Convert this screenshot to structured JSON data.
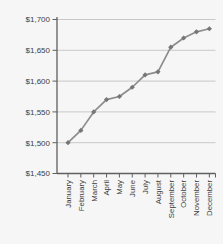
{
  "figure": {
    "name": "monthly-dollar-amount-line-chart",
    "title": "",
    "xlabel": "",
    "ylabel": ""
  },
  "chart_data": {
    "type": "line",
    "categories": [
      "January",
      "February",
      "March",
      "April",
      "May",
      "June",
      "July",
      "August",
      "September",
      "October",
      "November",
      "December"
    ],
    "values": [
      1500,
      1520,
      1550,
      1570,
      1575,
      1590,
      1610,
      1615,
      1655,
      1670,
      1680,
      1685
    ],
    "title": "",
    "xlabel": "",
    "ylabel": "",
    "ylim": [
      1450,
      1700
    ],
    "ytick_step": 50,
    "ytick_values": [
      1450,
      1500,
      1550,
      1600,
      1650,
      1700
    ],
    "ytick_labels": [
      "$1,450",
      "$1,500",
      "$1,550",
      "$1,600",
      "$1,650",
      "$1,700"
    ],
    "grid": true,
    "legend": false,
    "marker": "diamond",
    "colors": {
      "line": "#8d8d8d",
      "marker": "#767676",
      "grid": "#bcbcbc",
      "axis": "#5f5f5f",
      "label": "#3d3d3d",
      "background": "#f6f6f6"
    }
  }
}
